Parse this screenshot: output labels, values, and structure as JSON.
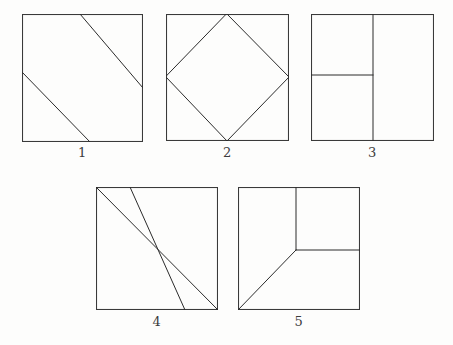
{
  "sheet": {
    "background_color": "#fdfdfc",
    "ink_color": "#2b2b2b",
    "description": "Hand-drawn worksheet of five numbered squares divided by straight lines"
  },
  "figures": [
    {
      "number": "1",
      "caption": "1",
      "name": "figure-1",
      "box": {
        "x": 22,
        "y": 14,
        "w": 121,
        "h": 128
      },
      "caption_pos": {
        "x": 22,
        "y": 145,
        "w": 121
      },
      "description": "Square crossed by two parallel diagonal lines running from upper-left to lower-right",
      "lines": [
        {
          "name": "diagonal-upper",
          "x1": 58,
          "y1": 0,
          "x2": 121,
          "y2": 74
        },
        {
          "name": "diagonal-lower",
          "x1": 0,
          "y1": 58,
          "x2": 68,
          "y2": 128
        }
      ]
    },
    {
      "number": "2",
      "caption": "2",
      "name": "figure-2",
      "box": {
        "x": 166,
        "y": 14,
        "w": 123,
        "h": 127
      },
      "caption_pos": {
        "x": 166,
        "y": 145,
        "w": 123
      },
      "description": "Square with an inscribed diamond joining the midpoints of the four sides",
      "lines": [
        {
          "name": "diamond-top-right",
          "x1": 61,
          "y1": 0,
          "x2": 123,
          "y2": 63
        },
        {
          "name": "diamond-right-bottom",
          "x1": 123,
          "y1": 63,
          "x2": 61,
          "y2": 127
        },
        {
          "name": "diamond-bottom-left",
          "x1": 61,
          "y1": 127,
          "x2": 0,
          "y2": 63
        },
        {
          "name": "diamond-left-top",
          "x1": 0,
          "y1": 63,
          "x2": 61,
          "y2": 0
        }
      ]
    },
    {
      "number": "3",
      "caption": "3",
      "name": "figure-3",
      "box": {
        "x": 311,
        "y": 14,
        "w": 123,
        "h": 127
      },
      "caption_pos": {
        "x": 311,
        "y": 145,
        "w": 123
      },
      "description": "Square split by a vertical line near the middle, with a horizontal line dividing the left portion in two",
      "lines": [
        {
          "name": "vertical-divider",
          "x1": 62,
          "y1": 0,
          "x2": 62,
          "y2": 127
        },
        {
          "name": "horizontal-divider-left",
          "x1": 0,
          "y1": 61,
          "x2": 62,
          "y2": 61
        }
      ]
    },
    {
      "number": "4",
      "caption": "4",
      "name": "figure-4",
      "box": {
        "x": 96,
        "y": 187,
        "w": 122,
        "h": 123
      },
      "caption_pos": {
        "x": 96,
        "y": 314,
        "w": 122
      },
      "description": "Square with its main diagonal from upper-left to lower-right plus a second parallel diagonal offset to the right",
      "lines": [
        {
          "name": "diagonal-main",
          "x1": 0,
          "y1": 0,
          "x2": 122,
          "y2": 123
        },
        {
          "name": "diagonal-parallel",
          "x1": 34,
          "y1": 0,
          "x2": 89,
          "y2": 123
        }
      ]
    },
    {
      "number": "5",
      "caption": "5",
      "name": "figure-5",
      "box": {
        "x": 238,
        "y": 187,
        "w": 122,
        "h": 123
      },
      "caption_pos": {
        "x": 238,
        "y": 314,
        "w": 122
      },
      "description": "Square with a vertical line from the top edge to an interior point, a horizontal line from that point to the right edge, and a diagonal from that point to the lower-left corner",
      "lines": [
        {
          "name": "vertical-upper",
          "x1": 58,
          "y1": 0,
          "x2": 58,
          "y2": 63
        },
        {
          "name": "horizontal-right",
          "x1": 58,
          "y1": 63,
          "x2": 122,
          "y2": 63
        },
        {
          "name": "diagonal-lower-left",
          "x1": 58,
          "y1": 63,
          "x2": 0,
          "y2": 123
        }
      ]
    }
  ]
}
